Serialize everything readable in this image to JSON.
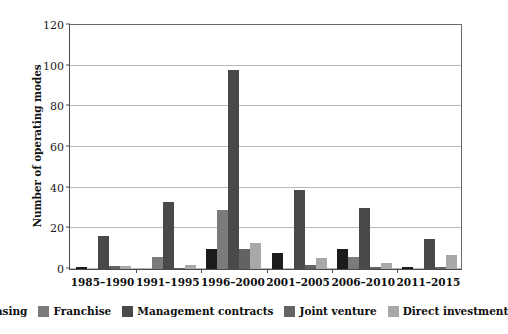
{
  "chart_data": {
    "type": "bar",
    "title": "",
    "subtitle": "",
    "xlabel": "",
    "ylabel": "Number of operating modes",
    "ylim": [
      0,
      120
    ],
    "yticks": [
      0,
      20,
      40,
      60,
      80,
      100,
      120
    ],
    "grid": true,
    "legend_position": "bottom",
    "categories": [
      "1985–1990",
      "1991–1995",
      "1996–2000",
      "2001–2005",
      "2006–2010",
      "2011–2015"
    ],
    "series": [
      {
        "name": "Leasing",
        "color": "#1c1c1c",
        "values": [
          1,
          0,
          10,
          8,
          10,
          1
        ]
      },
      {
        "name": "Franchise",
        "color": "#7b7b7b",
        "values": [
          0,
          6,
          29,
          0,
          6,
          0
        ]
      },
      {
        "name": "Management contracts",
        "color": "#494949",
        "values": [
          16,
          33,
          98,
          39,
          30,
          15
        ]
      },
      {
        "name": "Joint venture",
        "color": "#636363",
        "values": [
          1.5,
          0.5,
          10,
          2,
          1,
          1
        ]
      },
      {
        "name": "Direct investment",
        "color": "#a8a8a8",
        "values": [
          1.5,
          2,
          13,
          5.5,
          3,
          7
        ]
      }
    ]
  },
  "axis": {
    "y_title": "Number of operating modes",
    "tick_labels": [
      "0",
      "20",
      "40",
      "60",
      "80",
      "100",
      "120"
    ]
  },
  "legend": {
    "items": [
      {
        "label": "Leasing"
      },
      {
        "label": "Franchise"
      },
      {
        "label": "Management contracts"
      },
      {
        "label": "Joint venture"
      },
      {
        "label": "Direct investment"
      }
    ]
  }
}
